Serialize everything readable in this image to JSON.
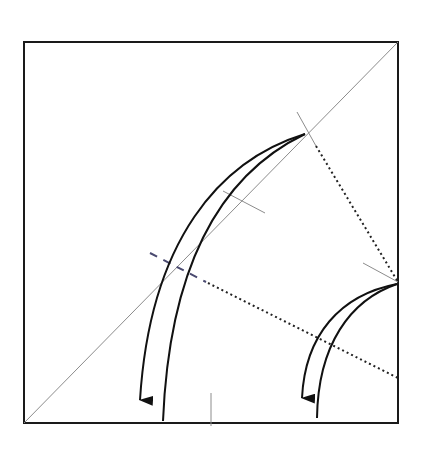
{
  "diagram": {
    "type": "origami-fold-instruction",
    "canvas": {
      "width": 430,
      "height": 452,
      "background": "#ffffff"
    },
    "colors": {
      "outline": "#1a1a1a",
      "crease": "#8c8c8c",
      "arrow": "#111111",
      "valley_fold": "#222222",
      "hidden_fold": "#4a4a70"
    },
    "paper": {
      "shape": "square",
      "x": 24,
      "y": 42,
      "size_w": 374,
      "size_h": 381
    },
    "creases": [
      {
        "name": "diagonal-crease",
        "from": [
          24,
          423
        ],
        "to": [
          398,
          42
        ]
      },
      {
        "name": "upper-perpendicular-crease",
        "from": [
          297,
          112
        ],
        "to": [
          316,
          146
        ]
      },
      {
        "name": "middle-tick-crease",
        "from": [
          223,
          191
        ],
        "to": [
          265,
          213
        ]
      },
      {
        "name": "right-corner-tick-crease",
        "from": [
          363,
          263
        ],
        "to": [
          398,
          282
        ]
      },
      {
        "name": "bottom-midpoint-tick",
        "from": [
          211,
          393
        ],
        "to": [
          211,
          426
        ]
      }
    ],
    "fold_lines": [
      {
        "name": "upper-valley-fold-line",
        "style": "dotted",
        "from": [
          316,
          146
        ],
        "to": [
          398,
          282
        ]
      },
      {
        "name": "lower-valley-fold-line",
        "style": "dotted",
        "from": [
          208,
          283
        ],
        "to": [
          398,
          378
        ]
      },
      {
        "name": "hidden-fold-line",
        "style": "dashed",
        "from": [
          150,
          253
        ],
        "to": [
          206,
          282
        ]
      }
    ],
    "arrows": [
      {
        "name": "large-fold-arrow",
        "tip": [
          140,
          415
        ],
        "origin": [
          305,
          134
        ]
      },
      {
        "name": "small-fold-arrow",
        "tip": [
          302,
          412
        ],
        "origin": [
          397,
          284
        ]
      }
    ]
  }
}
